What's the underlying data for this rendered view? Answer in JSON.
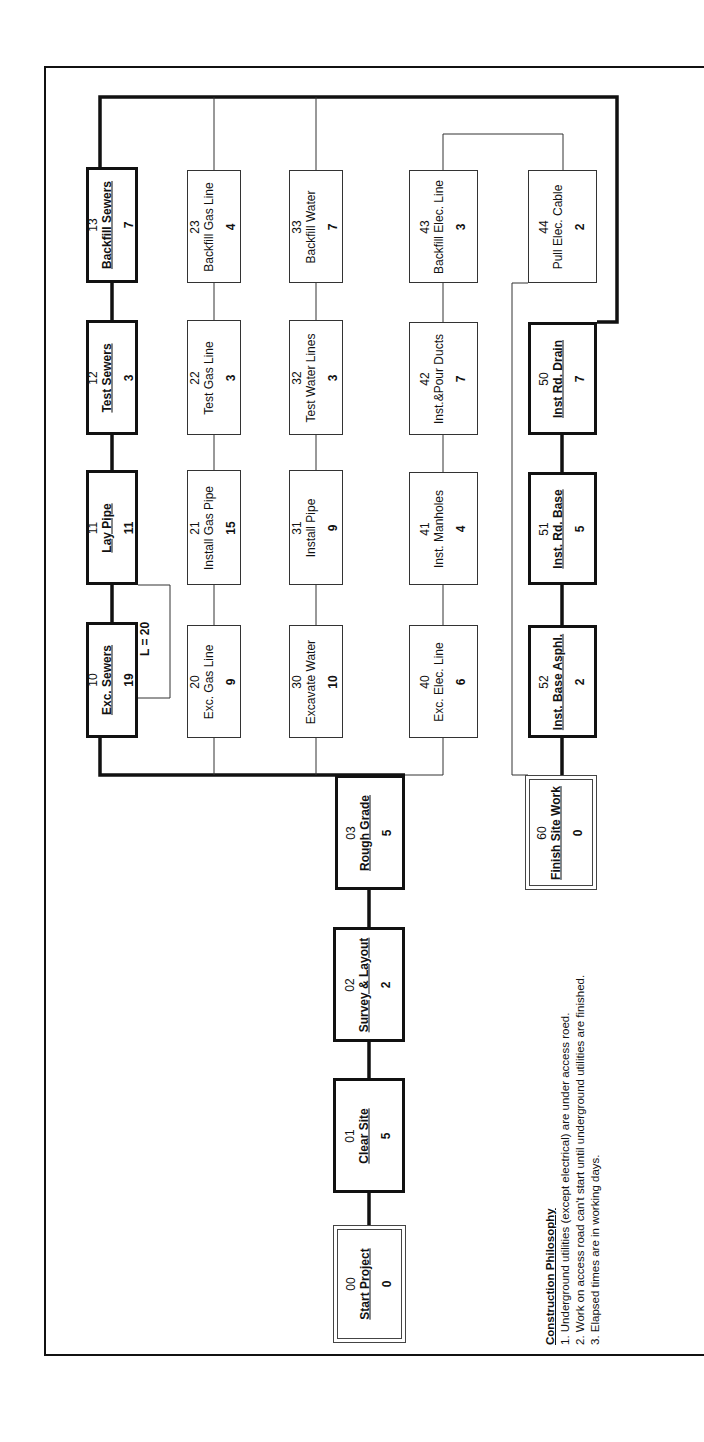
{
  "diagram": {
    "type": "precedence-network",
    "orientation": "rotated-90-ccw",
    "colors": {
      "line": "#111111",
      "background": "#ffffff"
    },
    "activities": [
      {
        "id": "00",
        "name": "Start Project",
        "duration": "0",
        "style": "milestone"
      },
      {
        "id": "01",
        "name": "Clear Site",
        "duration": "5",
        "style": "critical"
      },
      {
        "id": "02",
        "name": "Survey & Layout",
        "duration": "2",
        "style": "critical"
      },
      {
        "id": "03",
        "name": "Rough Grade",
        "duration": "5",
        "style": "critical"
      },
      {
        "id": "10",
        "name": "Exc. Sewers",
        "duration": "19",
        "style": "critical"
      },
      {
        "id": "11",
        "name": "Lay Pipe",
        "duration": "11",
        "style": "critical"
      },
      {
        "id": "12",
        "name": "Test Sewers",
        "duration": "3",
        "style": "critical"
      },
      {
        "id": "13",
        "name": "Backfill Sewers",
        "duration": "7",
        "style": "critical"
      },
      {
        "id": "20",
        "name": "Exc. Gas Line",
        "duration": "9",
        "style": "normal"
      },
      {
        "id": "21",
        "name": "Install Gas Pipe",
        "duration": "15",
        "style": "normal"
      },
      {
        "id": "22",
        "name": "Test Gas Line",
        "duration": "3",
        "style": "normal"
      },
      {
        "id": "23",
        "name": "Backfill Gas Line",
        "duration": "4",
        "style": "normal"
      },
      {
        "id": "30",
        "name": "Excavate Water",
        "duration": "10",
        "style": "normal"
      },
      {
        "id": "31",
        "name": "Install Pipe",
        "duration": "9",
        "style": "normal"
      },
      {
        "id": "32",
        "name": "Test Water Lines",
        "duration": "3",
        "style": "normal"
      },
      {
        "id": "33",
        "name": "Backfill Water",
        "duration": "7",
        "style": "normal"
      },
      {
        "id": "40",
        "name": "Exc. Elec. Line",
        "duration": "6",
        "style": "normal"
      },
      {
        "id": "41",
        "name": "Inst. Manholes",
        "duration": "4",
        "style": "normal"
      },
      {
        "id": "42",
        "name": "Inst.&Pour Ducts",
        "duration": "7",
        "style": "normal"
      },
      {
        "id": "43",
        "name": "Backfill Elec. Line",
        "duration": "3",
        "style": "normal"
      },
      {
        "id": "44",
        "name": "Pull Elec. Cable",
        "duration": "2",
        "style": "normal"
      },
      {
        "id": "50",
        "name": "Inst Rd. Drain",
        "duration": "7",
        "style": "critical"
      },
      {
        "id": "51",
        "name": "Inst. Rd. Base",
        "duration": "5",
        "style": "critical"
      },
      {
        "id": "52",
        "name": "Inst. Base Asphl.",
        "duration": "2",
        "style": "critical"
      },
      {
        "id": "60",
        "name": "Finish Site Work",
        "duration": "0",
        "style": "milestone"
      }
    ],
    "lag_label": "L =  20",
    "notes": {
      "title": "Construction Philosophy",
      "lines": [
        "1. Underground utilities (except electrical) are under access roed.",
        "2. Work on access road can't start until underground utilities are finished.",
        "3. Elapsed times are in working days."
      ]
    }
  }
}
